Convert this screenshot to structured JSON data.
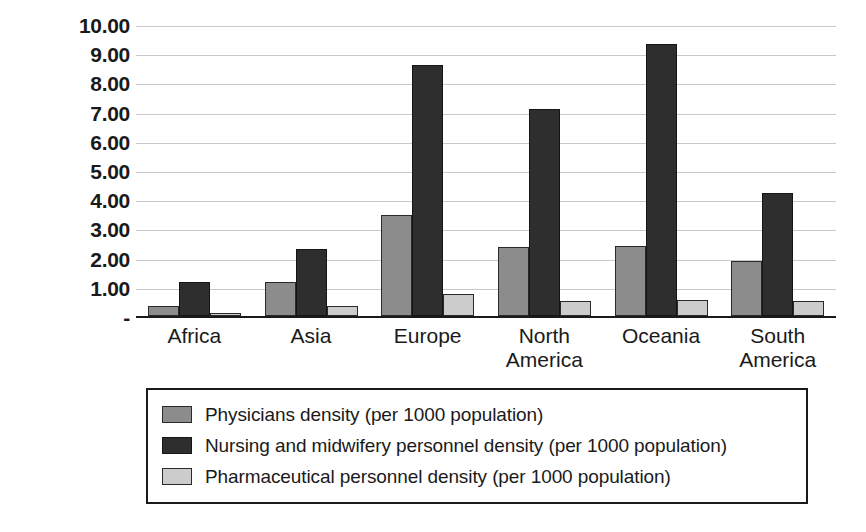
{
  "chart_data": {
    "type": "bar",
    "title": "",
    "subtitle": "",
    "xlabel": "",
    "ylabel": "",
    "ylim": [
      0,
      10
    ],
    "grid": true,
    "legend_position": "bottom",
    "categories": [
      "Africa",
      "Asia",
      "Europe",
      "North America",
      "Oceania",
      "South America"
    ],
    "category_lines": [
      [
        "Africa"
      ],
      [
        "Asia"
      ],
      [
        "Europe"
      ],
      [
        "North",
        "America"
      ],
      [
        "Oceania"
      ],
      [
        "South",
        "America"
      ]
    ],
    "ytick_labels": [
      "10.00",
      "9.00",
      "8.00",
      "7.00",
      "6.00",
      "5.00",
      "4.00",
      "3.00",
      "2.00",
      "1.00",
      "-"
    ],
    "ytick_values": [
      10,
      9,
      8,
      7,
      6,
      5,
      4,
      3,
      2,
      1,
      0
    ],
    "series": [
      {
        "name": "Physicians density (per 1000 population)",
        "color": "#8c8c8c",
        "values": [
          0.35,
          1.15,
          3.45,
          2.35,
          2.4,
          1.9
        ]
      },
      {
        "name": "Nursing and midwifery personnel density (per 1000 population)",
        "color": "#2e2e2e",
        "values": [
          1.15,
          2.3,
          8.6,
          7.1,
          9.3,
          4.2
        ]
      },
      {
        "name": "Pharmaceutical personnel density (per 1000 population)",
        "color": "#cccccc",
        "values": [
          0.1,
          0.35,
          0.75,
          0.5,
          0.55,
          0.5
        ]
      }
    ]
  }
}
